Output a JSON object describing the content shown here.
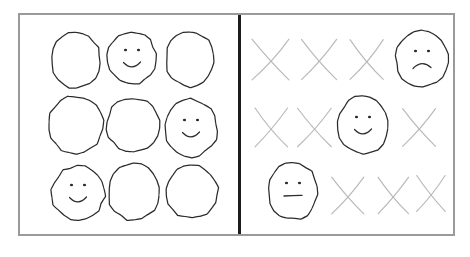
{
  "figure": {
    "style": "hand-drawn pencil sketch",
    "background_color": "#ffffff",
    "frame_border_color": "#9a9a9a",
    "divider_color": "#1c1c1c",
    "ink_dark_color": "#2b2b2b",
    "ink_light_color": "#b9b9bd"
  },
  "panels": [
    {
      "id": "left",
      "name": "circles-panel",
      "mark_type": "circle",
      "rows": 3,
      "columns": 3,
      "total_marks": 9,
      "faces_count": 3,
      "plain_count": 6,
      "cells": [
        {
          "index": 0,
          "row": 0,
          "col": 0,
          "mark": "circle",
          "face": "none",
          "cx": 56,
          "cy": 45
        },
        {
          "index": 1,
          "row": 0,
          "col": 1,
          "mark": "circle",
          "face": "smile",
          "cx": 112,
          "cy": 43
        },
        {
          "index": 2,
          "row": 0,
          "col": 2,
          "mark": "circle",
          "face": "none",
          "cx": 170,
          "cy": 44
        },
        {
          "index": 3,
          "row": 1,
          "col": 0,
          "mark": "circle",
          "face": "none",
          "cx": 56,
          "cy": 110
        },
        {
          "index": 4,
          "row": 1,
          "col": 1,
          "mark": "circle",
          "face": "none",
          "cx": 113,
          "cy": 110
        },
        {
          "index": 5,
          "row": 1,
          "col": 2,
          "mark": "circle",
          "face": "smile",
          "cx": 171,
          "cy": 113
        },
        {
          "index": 6,
          "row": 2,
          "col": 0,
          "mark": "circle",
          "face": "smile",
          "cx": 58,
          "cy": 178
        },
        {
          "index": 7,
          "row": 2,
          "col": 1,
          "mark": "circle",
          "face": "none",
          "cx": 114,
          "cy": 177
        },
        {
          "index": 8,
          "row": 2,
          "col": 2,
          "mark": "circle",
          "face": "none",
          "cx": 172,
          "cy": 177
        }
      ]
    },
    {
      "id": "right",
      "name": "crosses-panel",
      "mark_type": "cross",
      "rows": 3,
      "columns": 4,
      "total_marks": 12,
      "faces_count": 3,
      "cross_count": 9,
      "cells": [
        {
          "index": 0,
          "row": 0,
          "col": 0,
          "mark": "cross",
          "face": "none",
          "cx": 30,
          "cy": 44
        },
        {
          "index": 1,
          "row": 0,
          "col": 1,
          "mark": "cross",
          "face": "none",
          "cx": 78,
          "cy": 44
        },
        {
          "index": 2,
          "row": 0,
          "col": 2,
          "mark": "cross",
          "face": "none",
          "cx": 125,
          "cy": 44
        },
        {
          "index": 3,
          "row": 0,
          "col": 3,
          "mark": "circle",
          "face": "frown",
          "cx": 181,
          "cy": 44
        },
        {
          "index": 4,
          "row": 1,
          "col": 0,
          "mark": "cross",
          "face": "none",
          "cx": 30,
          "cy": 112
        },
        {
          "index": 5,
          "row": 1,
          "col": 1,
          "mark": "cross",
          "face": "none",
          "cx": 74,
          "cy": 112
        },
        {
          "index": 6,
          "row": 1,
          "col": 2,
          "mark": "circle",
          "face": "smile",
          "cx": 122,
          "cy": 110
        },
        {
          "index": 7,
          "row": 1,
          "col": 3,
          "mark": "cross",
          "face": "none",
          "cx": 179,
          "cy": 112
        },
        {
          "index": 8,
          "row": 2,
          "col": 0,
          "mark": "circle",
          "face": "neutral",
          "cx": 52,
          "cy": 176
        },
        {
          "index": 9,
          "row": 2,
          "col": 1,
          "mark": "cross",
          "face": "none",
          "cx": 108,
          "cy": 180
        },
        {
          "index": 10,
          "row": 2,
          "col": 2,
          "mark": "cross",
          "face": "none",
          "cx": 153,
          "cy": 180
        },
        {
          "index": 11,
          "row": 2,
          "col": 3,
          "mark": "cross",
          "face": "none",
          "cx": 190,
          "cy": 178
        }
      ]
    }
  ]
}
